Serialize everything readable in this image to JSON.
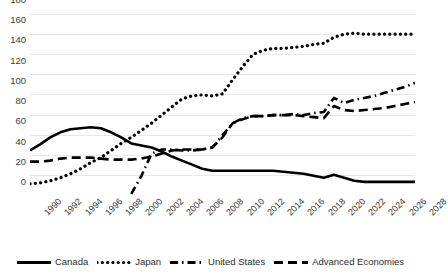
{
  "chart_data": {
    "type": "line",
    "title": "",
    "xlabel": "",
    "ylabel": "",
    "ylim": [
      0,
      180
    ],
    "ytick_step": 20,
    "grid": true,
    "legend_position": "bottom",
    "categories": [
      "1990",
      "1991",
      "1992",
      "1993",
      "1994",
      "1995",
      "1996",
      "1997",
      "1998",
      "1999",
      "2000",
      "2001",
      "2002",
      "2003",
      "2004",
      "2005",
      "2006",
      "2007",
      "2008",
      "2009",
      "2010",
      "2011",
      "2012",
      "2013",
      "2014",
      "2015",
      "2016",
      "2017",
      "2018",
      "2019",
      "2020",
      "2021",
      "2022",
      "2023",
      "2024",
      "2025",
      "2026",
      "2027",
      "2028"
    ],
    "xtick_labels": [
      "1990",
      "1992",
      "1994",
      "1996",
      "1998",
      "2000",
      "2002",
      "2004",
      "2006",
      "2008",
      "2010",
      "2012",
      "2014",
      "2016",
      "2018",
      "2020",
      "2022",
      "2024",
      "2026",
      "2028"
    ],
    "yticks": [
      0,
      20,
      40,
      60,
      80,
      100,
      120,
      140,
      160,
      180
    ],
    "series": [
      {
        "name": "Canada",
        "style": "solid",
        "color": "#000000",
        "values": [
          45,
          51,
          58,
          63,
          66,
          67,
          68,
          67,
          63,
          58,
          52,
          50,
          48,
          44,
          39,
          35,
          31,
          27,
          25,
          25,
          25,
          25,
          25,
          25,
          25,
          24,
          23,
          22,
          20,
          18,
          21,
          18,
          15,
          14,
          14,
          14,
          14,
          14,
          14
        ]
      },
      {
        "name": "Japan",
        "style": "dotted",
        "color": "#000000",
        "values": [
          12,
          13,
          15,
          18,
          22,
          27,
          33,
          38,
          45,
          52,
          58,
          65,
          72,
          80,
          88,
          96,
          99,
          100,
          99,
          101,
          115,
          128,
          140,
          144,
          146,
          146,
          147,
          148,
          150,
          151,
          157,
          160,
          161,
          160,
          160,
          160,
          160,
          160,
          160
        ]
      },
      {
        "name": "United States",
        "style": "dashdot",
        "color": "#000000",
        "values": [
          null,
          null,
          null,
          null,
          null,
          null,
          null,
          null,
          null,
          null,
          2,
          20,
          42,
          46,
          46,
          45,
          45,
          46,
          48,
          60,
          72,
          77,
          79,
          79,
          80,
          80,
          81,
          80,
          82,
          83,
          97,
          92,
          95,
          97,
          99,
          102,
          105,
          108,
          112
        ]
      },
      {
        "name": "Advanced Economies",
        "style": "dashed",
        "color": "#000000",
        "values": [
          34,
          34,
          35,
          37,
          38,
          38,
          38,
          37,
          36,
          36,
          36,
          37,
          39,
          42,
          45,
          46,
          46,
          46,
          48,
          58,
          72,
          76,
          79,
          79,
          80,
          80,
          80,
          79,
          78,
          77,
          89,
          85,
          84,
          85,
          86,
          87,
          89,
          91,
          93
        ]
      }
    ],
    "legend": [
      {
        "label": "Canada",
        "style": "solid"
      },
      {
        "label": "Japan",
        "style": "dotted"
      },
      {
        "label": "United States",
        "style": "dashdot"
      },
      {
        "label": "Advanced Economies",
        "style": "dashed"
      }
    ]
  }
}
